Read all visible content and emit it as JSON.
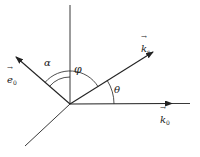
{
  "diagram": {
    "type": "vector-angle-diagram",
    "colors": {
      "line": "#222222",
      "background": "#ffffff"
    },
    "origin": {
      "x": 70,
      "y": 104
    },
    "lines": [
      {
        "name": "vertical-axis",
        "x2": 70,
        "y2": 5,
        "arrow": false
      },
      {
        "name": "lower-left-axis",
        "x2": 25,
        "y2": 146,
        "arrow": false
      },
      {
        "name": "e0-vector",
        "x2": 16,
        "y2": 57,
        "arrow": true
      },
      {
        "name": "ks-vector",
        "x2": 153,
        "y2": 52,
        "arrow": true
      },
      {
        "name": "k0-vector",
        "x2": 172,
        "y2": 103,
        "arrow": true
      },
      {
        "name": "k0-extension",
        "x2": 190,
        "y2": 103,
        "arrow": false
      }
    ],
    "vectors": {
      "e0": {
        "symbol": "e",
        "subscript": "0",
        "arrow": "→"
      },
      "ks": {
        "symbol": "k",
        "subscript": "s",
        "arrow": "→"
      },
      "k0": {
        "symbol": "k",
        "subscript": "0",
        "arrow": "→"
      }
    },
    "angles": {
      "alpha": {
        "label": "α",
        "between": [
          "e0",
          "vertical-axis"
        ]
      },
      "phi": {
        "label": "φ",
        "between": [
          "e0",
          "ks"
        ]
      },
      "theta": {
        "label": "θ",
        "between": [
          "ks",
          "k0"
        ]
      }
    }
  }
}
